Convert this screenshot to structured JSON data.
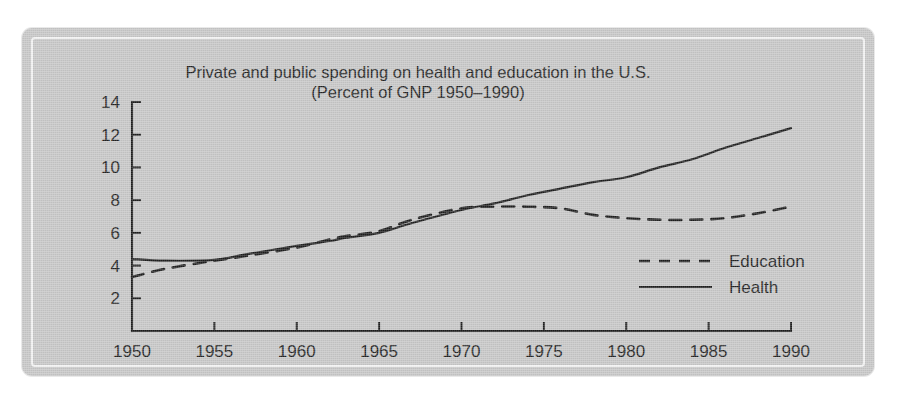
{
  "figure": {
    "background_color": "#ffffff",
    "plate_color": "#c6c6c6",
    "ink_color": "#1d1d1d",
    "inner_frame_color": "#f2f2f2"
  },
  "chart_data": {
    "type": "line",
    "title": "Private and public spending on health and education in the U.S.",
    "subtitle": "(Percent of GNP 1950–1990)",
    "xlabel": "",
    "ylabel": "",
    "xlim": [
      1950,
      1990
    ],
    "ylim": [
      0,
      14
    ],
    "yticks": [
      2,
      4,
      6,
      8,
      10,
      12,
      14
    ],
    "xticks": [
      1950,
      1955,
      1960,
      1965,
      1970,
      1975,
      1980,
      1985,
      1990
    ],
    "xtick_labels": [
      "1950",
      "1955",
      "1960",
      "1965",
      "1970",
      "1975",
      "1980",
      "1985",
      "1990"
    ],
    "ytick_labels": [
      "2",
      "4",
      "6",
      "8",
      "10",
      "12",
      "14"
    ],
    "grid": false,
    "legend_position": "center-right",
    "x": [
      1950,
      1952,
      1955,
      1957,
      1960,
      1962,
      1963,
      1965,
      1967,
      1970,
      1972,
      1974,
      1976,
      1978,
      1980,
      1982,
      1984,
      1986,
      1988,
      1990
    ],
    "series": [
      {
        "name": "Education",
        "style": "dashed",
        "color": "#1d1d1d",
        "values": [
          3.3,
          3.8,
          4.3,
          4.6,
          5.1,
          5.6,
          5.8,
          6.1,
          6.8,
          7.5,
          7.6,
          7.6,
          7.5,
          7.1,
          6.9,
          6.8,
          6.8,
          6.9,
          7.2,
          7.6
        ]
      },
      {
        "name": "Health",
        "style": "solid",
        "color": "#1d1d1d",
        "values": [
          4.4,
          4.3,
          4.35,
          4.7,
          5.2,
          5.5,
          5.7,
          6.0,
          6.6,
          7.4,
          7.8,
          8.3,
          8.7,
          9.1,
          9.4,
          10.0,
          10.5,
          11.2,
          11.8,
          12.4
        ]
      }
    ]
  },
  "legend": {
    "items": [
      {
        "label": "Education",
        "style": "dashed"
      },
      {
        "label": "Health",
        "style": "solid"
      }
    ]
  }
}
